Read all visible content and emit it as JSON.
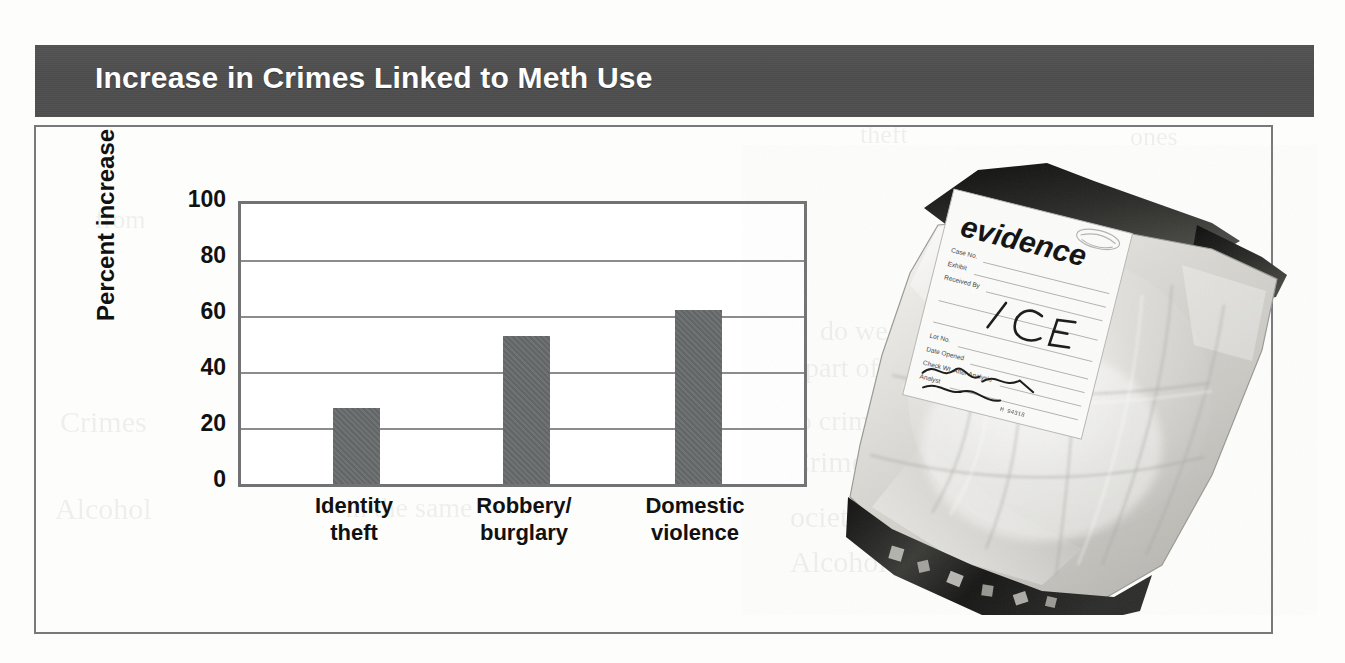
{
  "figure": {
    "title": "Increase in Crimes Linked to Meth Use",
    "title_bar_color": "#4f4f4f",
    "title_text_color": "#ffffff",
    "border_color": "#77797a"
  },
  "chart_data": {
    "type": "bar",
    "title": "Increase in Crimes Linked to Meth Use",
    "xlabel": "",
    "ylabel": "Percent increase",
    "categories": [
      "Identity theft",
      "Robbery/ burglary",
      "Domestic violence"
    ],
    "category_lines": [
      [
        "Identity",
        "theft"
      ],
      [
        "Robbery/",
        "burglary"
      ],
      [
        "Domestic",
        "violence"
      ]
    ],
    "values": [
      27,
      53,
      62
    ],
    "ylim": [
      0,
      100
    ],
    "yticks": [
      0,
      20,
      40,
      60,
      80,
      100
    ],
    "ytick_labels": [
      "0",
      "20",
      "40",
      "60",
      "80",
      "100"
    ],
    "grid": true,
    "grid_axis": "y",
    "legend": false,
    "bar_color": "#676b6b",
    "units": "percent"
  },
  "photo": {
    "caption_alt": "Clear plastic evidence bag containing white crystalline methamphetamine",
    "label_heading": "evidence",
    "label_fields": [
      "Case No.",
      "Exhibit",
      "Received By",
      "Lot No.",
      "Date Opened",
      "Check Wt. After Analysis",
      "Analyst"
    ],
    "handwritten_contents": "I C E",
    "handwritten_signature": "Tors"
  },
  "bleed_through": [
    {
      "text": "theft",
      "x": 860,
      "y": 120,
      "size": 26
    },
    {
      "text": "ones",
      "x": 1130,
      "y": 122,
      "size": 26
    },
    {
      "text": "from",
      "x": 95,
      "y": 205,
      "size": 26
    },
    {
      "text": "we",
      "x": 960,
      "y": 205,
      "size": 26
    },
    {
      "text": "233 c",
      "x": 425,
      "y": 248,
      "size": 26
    },
    {
      "text": "burglary",
      "x": 275,
      "y": 282,
      "size": 26
    },
    {
      "text": "rd",
      "x": 1000,
      "y": 248,
      "size": 26
    },
    {
      "text": "do we do",
      "x": 820,
      "y": 315,
      "size": 28
    },
    {
      "text": "part of",
      "x": 805,
      "y": 352,
      "size": 28
    },
    {
      "text": "Crimes",
      "x": 60,
      "y": 405,
      "size": 30
    },
    {
      "text": "ese questions de",
      "x": 330,
      "y": 405,
      "size": 28
    },
    {
      "text": "to crime",
      "x": 790,
      "y": 405,
      "size": 28
    },
    {
      "text": "bill to pay",
      "x": 275,
      "y": 438,
      "size": 28
    },
    {
      "text": "Crime and",
      "x": 790,
      "y": 445,
      "size": 30
    },
    {
      "text": "Alcohol",
      "x": 55,
      "y": 492,
      "size": 30
    },
    {
      "text": "in the same",
      "x": 345,
      "y": 492,
      "size": 28
    },
    {
      "text": "ociety",
      "x": 790,
      "y": 500,
      "size": 30
    },
    {
      "text": "Alcohol a",
      "x": 790,
      "y": 545,
      "size": 30
    }
  ]
}
